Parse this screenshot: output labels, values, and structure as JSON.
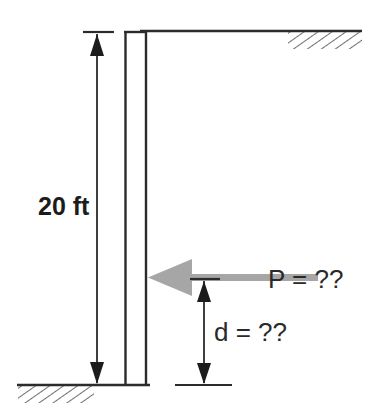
{
  "figure": {
    "background_color": "#ffffff",
    "line_color": "#2b2b2b",
    "force_color": "#a6a6a6",
    "hatch_color": "#4a4a4a",
    "width": 368,
    "height": 417
  },
  "labels": {
    "height_dimension": "20 ft",
    "force_label": "P = ??",
    "distance_dimension": "d = ??"
  },
  "elements": {
    "wall_name": "vertical-wall",
    "top_support_name": "top-support-surface",
    "ground_name": "ground-surface",
    "force_arrow_name": "applied-load-arrow",
    "height_dim_name": "height-dimension-line",
    "distance_dim_name": "distance-dimension-line"
  },
  "geometry": {
    "wall_left_x": 125,
    "wall_right_x": 146,
    "wall_top_y": 31,
    "wall_bottom_y": 385,
    "height_dim_x": 97,
    "distance_dim_x": 204,
    "load_y": 280,
    "top_line_right_x": 362,
    "ground_left_x": 17
  }
}
